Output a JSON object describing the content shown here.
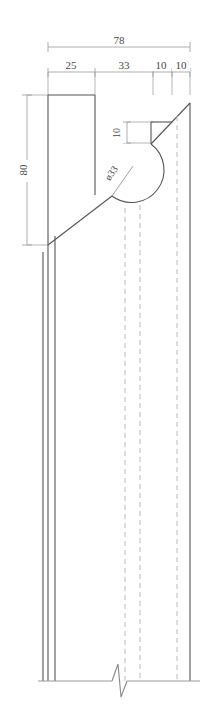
{
  "drawing": {
    "title": "Profile cross-section detail drawing",
    "units_note": "",
    "line_color": "#555555",
    "dim_line_color": "#9a9a9a",
    "hidden_line_color": "#b8b8b8",
    "text_color": "#4a4a4a",
    "background": "#ffffff"
  },
  "dimensions": {
    "overall_width": "78",
    "segment_1": "25",
    "segment_2": "33",
    "segment_3": "10",
    "segment_4": "10",
    "height_left": "80",
    "notch_depth": "10",
    "diameter_label": "ø33"
  },
  "annotations": {
    "break_symbol_name": "break-line",
    "hidden_lines_count": "3"
  }
}
